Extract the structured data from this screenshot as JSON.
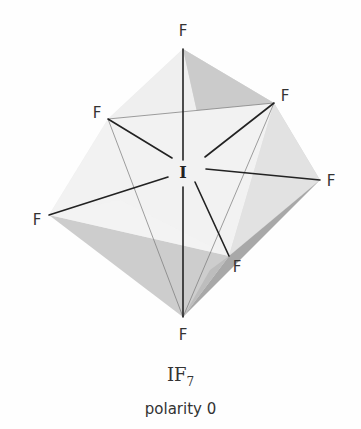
{
  "molecule": {
    "formula_main": "IF",
    "formula_subscript": "7",
    "polarity_label": "polarity 0",
    "geometry": "pentagonal bipyramidal",
    "central_atom": "I",
    "ligands": [
      {
        "id": "top",
        "label": "F"
      },
      {
        "id": "upper-left",
        "label": "F"
      },
      {
        "id": "upper-right",
        "label": "F"
      },
      {
        "id": "right",
        "label": "F"
      },
      {
        "id": "left",
        "label": "F"
      },
      {
        "id": "lower-right",
        "label": "F"
      },
      {
        "id": "bottom",
        "label": "F"
      }
    ]
  },
  "colors": {
    "bond": "#222222",
    "edge_thin": "#666666",
    "face_light": "#e8e8e8",
    "face_mid": "#d2d2d2",
    "face_dark": "#b8b8b8",
    "face_darkest": "#9a9a9a"
  }
}
